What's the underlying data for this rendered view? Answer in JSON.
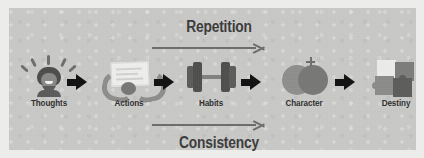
{
  "figure": {
    "panel_background_color": "#c9c9c7",
    "page_background_color": "#ececeb"
  },
  "flow_annotations": {
    "top": {
      "label": "Repetition",
      "arrow_direction": "left-to-right",
      "color": "#3b3b3b"
    },
    "bottom": {
      "label": "Consistency",
      "arrow_direction": "left-to-right",
      "color": "#3b3b3b"
    }
  },
  "chain": {
    "connector_label": "",
    "connector_count": 4,
    "nodes": [
      {
        "id": "thoughts",
        "label": "Thoughts",
        "icon": "head-with-idea-rays-icon",
        "accent_color": "#4d4d4d"
      },
      {
        "id": "actions",
        "label": "Actions",
        "icon": "hands-writing-paper-icon",
        "accent_color": "#8e8e8c"
      },
      {
        "id": "habits",
        "label": "Habits",
        "icon": "dumbbell-icon",
        "accent_color": "#4f4f4d"
      },
      {
        "id": "character",
        "label": "Character",
        "icon": "overlapping-circles-icon",
        "accent_color": "#8f8f8d"
      },
      {
        "id": "destiny",
        "label": "Destiny",
        "icon": "jigsaw-puzzle-icon",
        "accent_color": "#5d5d5b"
      }
    ]
  }
}
